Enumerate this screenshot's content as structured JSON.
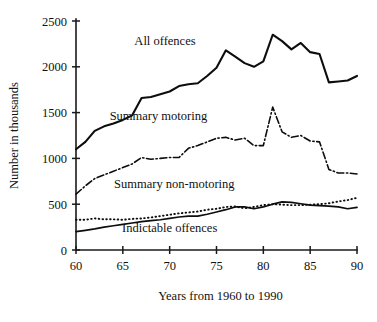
{
  "chart_data": {
    "type": "line",
    "title": "",
    "xlabel": "Years from 1960 to 1990",
    "ylabel": "Number in thousands",
    "xlim": [
      60,
      90
    ],
    "ylim": [
      0,
      2500
    ],
    "grid": false,
    "legend_position": "inline-labels",
    "x_ticks": [
      "60",
      "65",
      "70",
      "75",
      "80",
      "85",
      "90"
    ],
    "x_tick_values": [
      60,
      65,
      70,
      75,
      80,
      85,
      90
    ],
    "y_ticks": [
      "0",
      "500",
      "1000",
      "1500",
      "2000",
      "2500"
    ],
    "y_tick_values": [
      0,
      500,
      1000,
      1500,
      2000,
      2500
    ],
    "x": [
      60,
      61,
      62,
      63,
      64,
      65,
      66,
      67,
      68,
      69,
      70,
      71,
      72,
      73,
      74,
      75,
      76,
      77,
      78,
      79,
      80,
      81,
      82,
      83,
      84,
      85,
      86,
      87,
      88,
      89,
      90
    ],
    "series": [
      {
        "name": "All offences",
        "style": "solid",
        "color": "#0d0d0d",
        "label_x": 69.5,
        "label_y": 2235,
        "values": [
          1100,
          1180,
          1300,
          1350,
          1380,
          1420,
          1470,
          1660,
          1670,
          1700,
          1730,
          1790,
          1810,
          1820,
          1900,
          1990,
          2180,
          2110,
          2040,
          2000,
          2060,
          2350,
          2280,
          2190,
          2260,
          2160,
          2140,
          1830,
          1840,
          1850,
          1900
        ]
      },
      {
        "name": "Summary motoring",
        "style": "dash-dot",
        "color": "#0d0d0d",
        "label_x": 68.8,
        "label_y": 1415,
        "values": [
          610,
          700,
          780,
          820,
          860,
          900,
          940,
          1010,
          990,
          1000,
          1010,
          1010,
          1110,
          1140,
          1180,
          1220,
          1230,
          1200,
          1220,
          1140,
          1140,
          1560,
          1290,
          1230,
          1250,
          1190,
          1180,
          880,
          840,
          840,
          830
        ]
      },
      {
        "name": "Summary non-motoring",
        "style": "dotted",
        "color": "#0d0d0d",
        "label_x": 70.5,
        "label_y": 680,
        "values": [
          330,
          330,
          345,
          335,
          335,
          330,
          340,
          345,
          355,
          370,
          385,
          400,
          410,
          420,
          440,
          450,
          470,
          475,
          455,
          470,
          490,
          500,
          495,
          490,
          490,
          495,
          500,
          510,
          530,
          545,
          570
        ]
      },
      {
        "name": "Indictable offences",
        "style": "solid-thin",
        "color": "#0d0d0d",
        "label_x": 70.0,
        "label_y": 200,
        "values": [
          200,
          215,
          230,
          250,
          265,
          280,
          295,
          310,
          320,
          330,
          345,
          360,
          370,
          370,
          390,
          415,
          440,
          470,
          470,
          450,
          470,
          500,
          525,
          520,
          505,
          490,
          485,
          480,
          470,
          450,
          465
        ]
      }
    ]
  }
}
